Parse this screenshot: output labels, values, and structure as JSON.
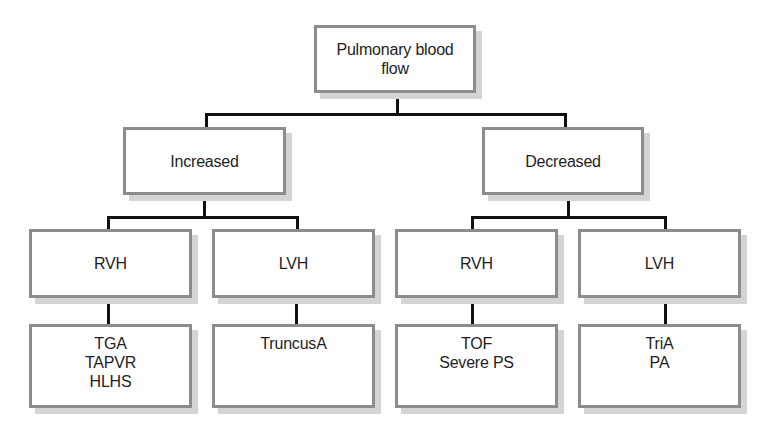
{
  "diagram": {
    "root": {
      "lines": [
        "Pulmonary blood",
        "flow"
      ]
    },
    "level1": [
      {
        "label": "Increased"
      },
      {
        "label": "Decreased"
      }
    ],
    "level2": [
      {
        "label": "RVH",
        "parent": "Increased"
      },
      {
        "label": "LVH",
        "parent": "Increased"
      },
      {
        "label": "RVH",
        "parent": "Decreased"
      },
      {
        "label": "LVH",
        "parent": "Decreased"
      }
    ],
    "leaves": [
      {
        "parent": "Increased / RVH",
        "items": [
          "TGA",
          "TAPVR",
          "HLHS"
        ]
      },
      {
        "parent": "Increased / LVH",
        "items": [
          "TruncusA"
        ]
      },
      {
        "parent": "Decreased / RVH",
        "items": [
          "TOF",
          "Severe PS"
        ]
      },
      {
        "parent": "Decreased / LVH",
        "items": [
          "TriA",
          "PA"
        ]
      }
    ]
  },
  "colors": {
    "box_border": "#8c8c8c",
    "box_shadow": "#d4d4d4",
    "connector": "#111111",
    "text": "#1e1e1e",
    "background": "#ffffff"
  }
}
